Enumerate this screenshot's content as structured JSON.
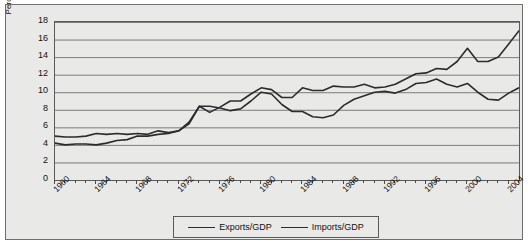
{
  "chart_data": {
    "type": "line",
    "title": "",
    "xlabel": "Year",
    "ylabel": "Percentage of GDP",
    "xlim": [
      1960,
      2005
    ],
    "ylim": [
      0,
      18
    ],
    "ytick_step": 2,
    "grid": true,
    "legend_position": "bottom",
    "x_tick_labels": [
      "1960",
      "1964",
      "1968",
      "1972",
      "1976",
      "1980",
      "1984",
      "1988",
      "1992",
      "1996",
      "2000",
      "2004"
    ],
    "y_tick_labels": [
      "0",
      "2",
      "4",
      "6",
      "8",
      "10",
      "12",
      "14",
      "16",
      "18"
    ],
    "x": [
      1960,
      1961,
      1962,
      1963,
      1964,
      1965,
      1966,
      1967,
      1968,
      1969,
      1970,
      1971,
      1972,
      1973,
      1974,
      1975,
      1976,
      1977,
      1978,
      1979,
      1980,
      1981,
      1982,
      1983,
      1984,
      1985,
      1986,
      1987,
      1988,
      1989,
      1990,
      1991,
      1992,
      1993,
      1994,
      1995,
      1996,
      1997,
      1998,
      1999,
      2000,
      2001,
      2002,
      2003,
      2004,
      2005
    ],
    "series": [
      {
        "name": "Exports/GDP",
        "color": "#2c2c2c",
        "values": [
          5.0,
          4.9,
          4.9,
          5.0,
          5.3,
          5.2,
          5.3,
          5.2,
          5.3,
          5.2,
          5.6,
          5.4,
          5.6,
          6.6,
          8.4,
          8.4,
          8.2,
          7.9,
          8.1,
          9.0,
          10.0,
          9.8,
          8.6,
          7.8,
          7.8,
          7.2,
          7.1,
          7.4,
          8.5,
          9.2,
          9.6,
          10.0,
          10.1,
          9.9,
          10.3,
          11.0,
          11.1,
          11.5,
          10.9,
          10.6,
          11.0,
          10.0,
          9.2,
          9.1,
          9.9,
          10.5
        ]
      },
      {
        "name": "Imports/GDP",
        "color": "#2c2c2c",
        "values": [
          4.2,
          4.0,
          4.1,
          4.1,
          4.0,
          4.2,
          4.5,
          4.6,
          5.0,
          5.0,
          5.2,
          5.3,
          5.6,
          6.4,
          8.4,
          7.7,
          8.3,
          9.0,
          9.0,
          9.8,
          10.5,
          10.3,
          9.4,
          9.4,
          10.5,
          10.2,
          10.2,
          10.7,
          10.6,
          10.6,
          10.9,
          10.5,
          10.6,
          10.9,
          11.5,
          12.1,
          12.2,
          12.7,
          12.6,
          13.5,
          15.0,
          13.5,
          13.5,
          14.0,
          15.5,
          17.0
        ]
      }
    ]
  },
  "axis": {
    "y_title": "Percentage of GDP",
    "x_title": "Year"
  },
  "legend": {
    "items": [
      {
        "label": "Exports/GDP"
      },
      {
        "label": "Imports/GDP"
      }
    ]
  }
}
